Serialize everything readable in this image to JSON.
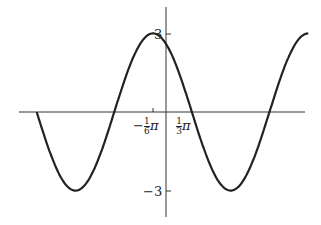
{
  "chart_data": {
    "type": "line",
    "title": "",
    "function": "y = 3 cos(x + π/6)",
    "xlabel": "",
    "ylabel": "",
    "ylim": [
      -3,
      3
    ],
    "x_ticks": [
      {
        "label_sign": "−",
        "num": "1",
        "den": "6",
        "sym": "π",
        "value": -0.5236
      },
      {
        "label_sign": "",
        "num": "1",
        "den": "3",
        "sym": "π",
        "value": 1.0472
      }
    ],
    "y_ticks": [
      {
        "label": "3",
        "value": 3
      },
      {
        "label": "−3",
        "value": -3
      }
    ],
    "key_points": [
      {
        "x": -5.236,
        "y": 0
      },
      {
        "x": -3.665,
        "y": -3
      },
      {
        "x": -2.094,
        "y": 0
      },
      {
        "x": -0.5236,
        "y": 3
      },
      {
        "x": 1.0472,
        "y": 0
      },
      {
        "x": 2.618,
        "y": -3
      },
      {
        "x": 4.189,
        "y": 0
      },
      {
        "x": 5.76,
        "y": 3
      }
    ],
    "grid": false,
    "color": "#222222"
  }
}
